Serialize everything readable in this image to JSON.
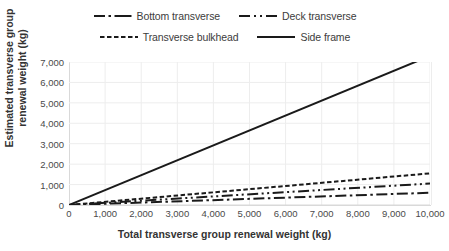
{
  "chart_data": {
    "type": "line",
    "title": "",
    "xlabel": "Total transverse group renewal weight (kg)",
    "ylabel": "Estimated transverse group renewal weight (kg)",
    "xlim": [
      0,
      10000
    ],
    "ylim": [
      0,
      7000
    ],
    "xticks": [
      "0",
      "1,000",
      "2,000",
      "3,000",
      "4,000",
      "5,000",
      "6,000",
      "7,000",
      "8,000",
      "9,000",
      "10,000"
    ],
    "xtick_values": [
      0,
      1000,
      2000,
      3000,
      4000,
      5000,
      6000,
      7000,
      8000,
      9000,
      10000
    ],
    "yticks": [
      "0",
      "1,000",
      "2,000",
      "3,000",
      "4,000",
      "5,000",
      "6,000",
      "7,000"
    ],
    "ytick_values": [
      0,
      1000,
      2000,
      3000,
      4000,
      5000,
      6000,
      7000
    ],
    "grid": true,
    "legend_position": "top",
    "x": [
      0,
      10000
    ],
    "series": [
      {
        "name": "Bottom transverse",
        "values": [
          0,
          600
        ],
        "dash": "dashdot",
        "color": "#1a1a1a",
        "width": 2.0
      },
      {
        "name": "Deck transverse",
        "values": [
          0,
          1050
        ],
        "dash": "dashdotdot",
        "color": "#1a1a1a",
        "width": 2.0
      },
      {
        "name": "Transverse bulkhead",
        "values": [
          0,
          1550
        ],
        "dash": "dashed",
        "color": "#1a1a1a",
        "width": 2.0
      },
      {
        "name": "Side frame",
        "values": [
          0,
          7300
        ],
        "dash": "solid",
        "color": "#1a1a1a",
        "width": 2.0
      }
    ],
    "legend_rows": [
      [
        "Bottom transverse",
        "Deck transverse"
      ],
      [
        "Transverse bulkhead",
        "Side frame"
      ]
    ],
    "colors": {
      "grid": "#ededed",
      "axis": "#d9d9d9",
      "text": "#3c3c3c",
      "background": "#ffffff",
      "line": "#1a1a1a"
    }
  }
}
